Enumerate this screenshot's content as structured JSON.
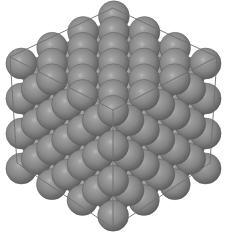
{
  "image": {
    "subject": "FCC close-packed spheres in cubic unit cell",
    "background": "#ffffff",
    "sphere_color": "#8a8a8a",
    "sphere_highlight": "#c8c8c8",
    "sphere_shadow": "#4a4a4a",
    "edge_color": "#6e6e6e"
  },
  "cube": {
    "vertices": {
      "top": [
        113,
        8
      ],
      "left_top": [
        10,
        57
      ],
      "right_top": [
        217,
        57
      ],
      "center": [
        113,
        110
      ],
      "left_bottom": [
        17,
        163
      ],
      "right_bottom": [
        210,
        163
      ],
      "bottom": [
        113,
        228
      ]
    }
  }
}
